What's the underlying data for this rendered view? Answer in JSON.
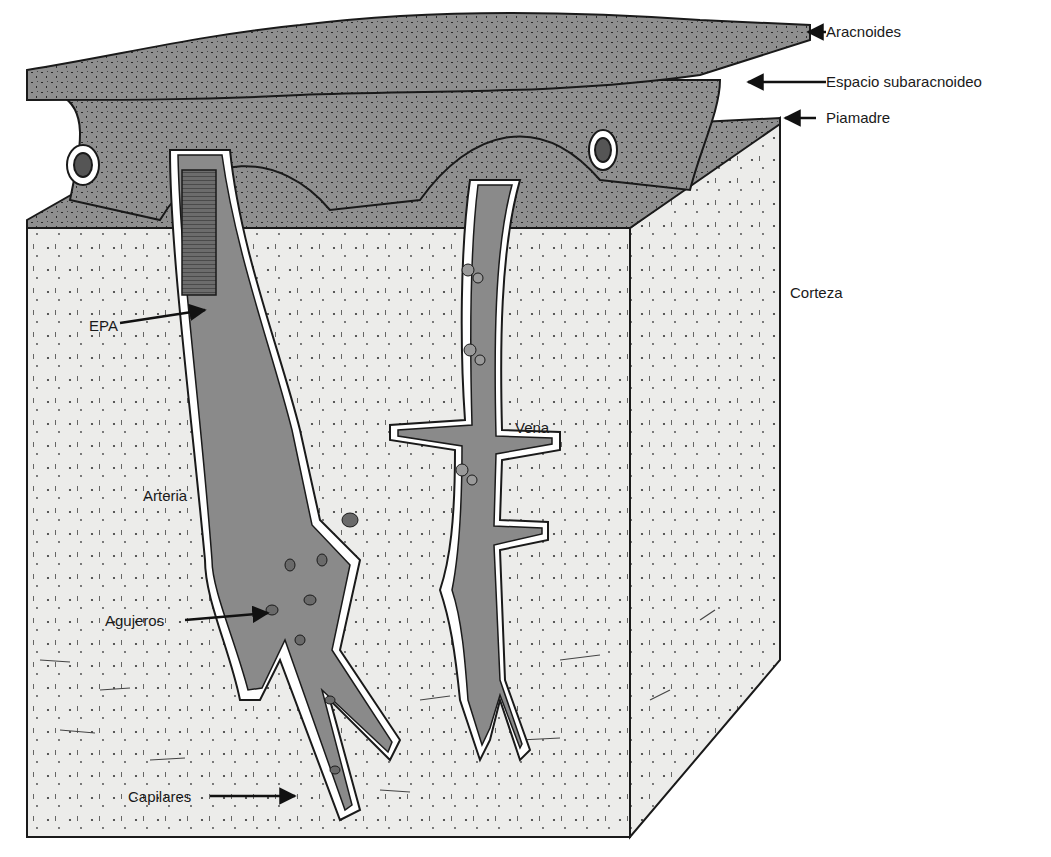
{
  "figure": {
    "colors": {
      "background": "#ffffff",
      "tissue_block": "#ececea",
      "meninges_fill": "#8f8f8f",
      "vessel_fill": "#8a8a8a",
      "vessel_dark": "#6a6a6a",
      "outline": "#1a1a1a"
    }
  },
  "labels": {
    "aracnoides": "Aracnoides",
    "espacio_subaracnoideo": "Espacio subaracnoideo",
    "piamadre": "Piamadre",
    "corteza": "Corteza",
    "epa": "EPA",
    "vena": "Vena",
    "arteria": "Arteria",
    "agujeros": "Agujeros",
    "capilares": "Capilares"
  }
}
